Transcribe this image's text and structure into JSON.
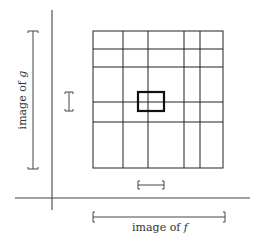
{
  "labels": {
    "image_f": "image of ",
    "image_f_var": "f",
    "image_g": "image of ",
    "image_g_var": "g"
  },
  "colors": {
    "line": "#333333",
    "grid": "#222222",
    "highlight": "#111111"
  },
  "grid": {
    "left": 93,
    "right": 223,
    "top": 31,
    "bottom": 168,
    "vertical_lines": [
      123,
      148,
      184,
      200
    ],
    "horizontal_lines": [
      49,
      67,
      102,
      122
    ]
  },
  "highlight_rect": {
    "x1": 138,
    "y1": 92,
    "x2": 164,
    "y2": 111
  },
  "axes": {
    "x_axis": {
      "y": 198,
      "x1": 15,
      "x2": 250
    },
    "y_axis": {
      "x": 52,
      "y1": 10,
      "y2": 210
    }
  },
  "brackets": {
    "image_g": {
      "x": 33,
      "y1": 31,
      "y2": 169
    },
    "small_vertical": {
      "x": 69,
      "y1": 92,
      "y2": 111
    },
    "image_f": {
      "y": 217,
      "x1": 93,
      "x2": 225
    },
    "small_horizontal": {
      "y": 185,
      "x1": 138,
      "x2": 164
    }
  }
}
